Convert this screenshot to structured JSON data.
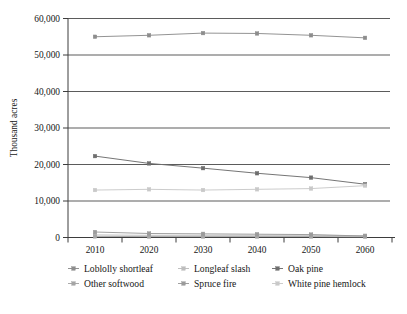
{
  "chart_data": {
    "type": "line",
    "title": "",
    "subtitle": "",
    "xlabel": "",
    "ylabel": "Thousand acres",
    "categories": [
      "2010",
      "2020",
      "2030",
      "2040",
      "2050",
      "2060"
    ],
    "x": [
      2010,
      2020,
      2030,
      2040,
      2050,
      2060
    ],
    "xlim": [
      2005,
      2065
    ],
    "ylim": [
      0,
      60000
    ],
    "yticks": [
      0,
      10000,
      20000,
      30000,
      40000,
      50000,
      60000
    ],
    "ytick_labels": [
      "0",
      "10,000",
      "20,000",
      "30,000",
      "40,000",
      "50,000",
      "60,000"
    ],
    "xtick_labels": [
      "2010",
      "2020",
      "2030",
      "2040",
      "2050",
      "2060"
    ],
    "grid": "horizontal",
    "legend_position": "bottom",
    "legend_columns": 3,
    "series": [
      {
        "name": "Loblolly shortleaf",
        "values": [
          55000,
          55400,
          56000,
          55900,
          55400,
          54700
        ],
        "color": "#8d8d8d",
        "marker": "square"
      },
      {
        "name": "Longleaf slash",
        "values": [
          700,
          600,
          600,
          600,
          600,
          500
        ],
        "color": "#bdbdbd",
        "marker": "square"
      },
      {
        "name": "Oak pine",
        "values": [
          22300,
          20300,
          19000,
          17600,
          16400,
          14600
        ],
        "color": "#6e6e6e",
        "marker": "square"
      },
      {
        "name": "Other softwood",
        "values": [
          300,
          250,
          250,
          250,
          250,
          200
        ],
        "color": "#a5a5a5",
        "marker": "square"
      },
      {
        "name": "Spruce fire",
        "values": [
          1500,
          1100,
          1000,
          900,
          800,
          400
        ],
        "color": "#9b9b9b",
        "marker": "square"
      },
      {
        "name": "White pine hemlock",
        "values": [
          13000,
          13200,
          13000,
          13200,
          13400,
          14200
        ],
        "color": "#c9c9c9",
        "marker": "square"
      }
    ]
  },
  "legend": {
    "items": [
      {
        "label": "Loblolly shortleaf",
        "color": "#8d8d8d"
      },
      {
        "label": "Longleaf slash",
        "color": "#bdbdbd"
      },
      {
        "label": "Oak pine",
        "color": "#6e6e6e"
      },
      {
        "label": "Other softwood",
        "color": "#a5a5a5"
      },
      {
        "label": "Spruce fire",
        "color": "#9b9b9b"
      },
      {
        "label": "White pine hemlock",
        "color": "#c9c9c9"
      }
    ]
  },
  "axes": {
    "y_title": "Thousand acres"
  },
  "colors": {
    "axis": "#3d3d3d",
    "grid": "#3d3d3d",
    "text": "#161616",
    "background": "#ffffff"
  }
}
